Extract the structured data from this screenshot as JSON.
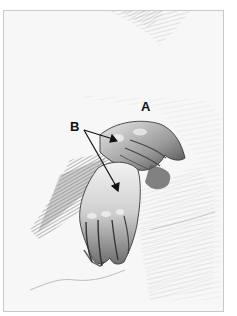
{
  "figure": {
    "labels": {
      "a": "A",
      "b": "B"
    },
    "annotations": [
      {
        "label": "A",
        "x": 145,
        "y": 106
      },
      {
        "label": "B",
        "x": 76,
        "y": 126,
        "arrows": [
          {
            "from": [
              84,
              130
            ],
            "to": [
              116,
              140
            ]
          },
          {
            "from": [
              84,
              130
            ],
            "to": [
              118,
              190
            ]
          }
        ]
      }
    ],
    "colors": {
      "paper": "#f7f7f7",
      "frame": "#c9c9c9",
      "graphite_dark": "#3a3a3a",
      "graphite_mid": "#8a8a8a",
      "graphite_light": "#cfcfcf",
      "label": "#111111"
    }
  }
}
